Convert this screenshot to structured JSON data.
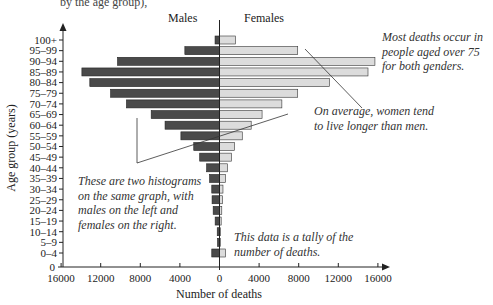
{
  "header": {
    "partial_text": "by the age group),"
  },
  "chart_data": {
    "type": "bar",
    "orientation": "horizontal-population-pyramid",
    "title": "",
    "xlabel": "Number of deaths",
    "ylabel": "Age group (years)",
    "x_ticks_left": [
      "16000",
      "12000",
      "8000",
      "4000",
      "0"
    ],
    "x_ticks_right": [
      "4000",
      "8000",
      "12000",
      "16000"
    ],
    "x_tick_values_left": [
      16000,
      12000,
      8000,
      4000,
      0
    ],
    "x_tick_values_right": [
      4000,
      8000,
      12000,
      16000
    ],
    "xlim": [
      0,
      16000
    ],
    "y_zero_label": "0",
    "categories": [
      "100+",
      "95–99",
      "90–94",
      "85–89",
      "80–84",
      "75–79",
      "70–74",
      "65–69",
      "60–64",
      "55–59",
      "50–54",
      "45–49",
      "40–44",
      "35–39",
      "30–34",
      "25–29",
      "20–24",
      "15–19",
      "10–14",
      "5–9",
      "0–4"
    ],
    "series": [
      {
        "name": "Males",
        "side": "left",
        "color": "#4a4a4a",
        "values": [
          450,
          3500,
          10300,
          13900,
          13100,
          11000,
          9400,
          6900,
          5500,
          3900,
          2600,
          2000,
          1300,
          1000,
          780,
          750,
          640,
          440,
          230,
          200,
          780
        ]
      },
      {
        "name": "Females",
        "side": "right",
        "color": "#dcdcdc",
        "values": [
          1600,
          7900,
          15700,
          15000,
          11100,
          7900,
          6300,
          4300,
          3200,
          2300,
          1500,
          1200,
          800,
          600,
          350,
          300,
          230,
          170,
          100,
          80,
          600
        ]
      }
    ],
    "grid": false,
    "legend": "top",
    "annotations": [
      {
        "id": "most-deaths",
        "lines": [
          "Most deaths occur in",
          "people aged over 75",
          "for both genders."
        ]
      },
      {
        "id": "women-longer",
        "lines": [
          "On average, women tend",
          "to live longer than men."
        ]
      },
      {
        "id": "two-histograms",
        "lines": [
          "These are two histograms",
          "on the same graph, with",
          "males on the left and",
          "females on the right."
        ]
      },
      {
        "id": "tally",
        "lines": [
          "This data is a tally of the",
          "number of deaths."
        ]
      }
    ]
  }
}
